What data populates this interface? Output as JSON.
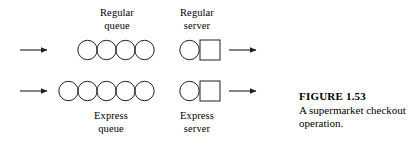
{
  "figure": {
    "caption_title": "FIGURE 1.53",
    "caption_text": "A supermarket checkout operation.",
    "labels": {
      "regular_queue_line1": "Regular",
      "regular_queue_line2": "queue",
      "regular_server_line1": "Regular",
      "regular_server_line2": "server",
      "express_queue_line1": "Express",
      "express_queue_line2": "queue",
      "express_server_line1": "Express",
      "express_server_line2": "server"
    },
    "colors": {
      "stroke": "#231f20",
      "text": "#000000",
      "background": "#ffffff"
    },
    "rows": [
      {
        "name": "regular-lane",
        "queue_customers": 4,
        "servers": 1,
        "has_input_arrow": true,
        "has_output_arrow": true
      },
      {
        "name": "express-lane",
        "queue_customers": 5,
        "servers": 1,
        "has_input_arrow": true,
        "has_output_arrow": true
      }
    ]
  }
}
